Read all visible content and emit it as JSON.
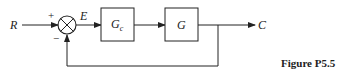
{
  "diagram": {
    "type": "block-diagram",
    "input_label": "R",
    "error_label": "E",
    "output_label": "C",
    "summing_junction": {
      "plus_sign": "+",
      "minus_sign": "−"
    },
    "blocks": [
      {
        "id": "controller",
        "label_main": "G",
        "label_sub": "c"
      },
      {
        "id": "plant",
        "label_main": "G",
        "label_sub": ""
      }
    ],
    "feedback": "unity negative",
    "caption": "Figure P5.5"
  }
}
